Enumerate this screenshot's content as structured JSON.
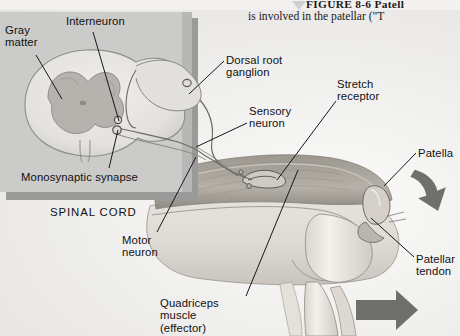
{
  "figure": {
    "caption_line1": "FIGURE  8-6  Patell",
    "caption_line2": "is involved in the patellar (\"T",
    "marker_icon": "triangle-marker-icon"
  },
  "panel": {
    "name": "spinal-cord-inset-panel",
    "background_color": "#c8c8c6",
    "shadow_color": "#9a9a98"
  },
  "labels": [
    {
      "id": "gray-matter",
      "text": "Gray\nmatter",
      "x": 5,
      "y": 14,
      "align": "left"
    },
    {
      "id": "interneuron",
      "text": "Interneuron",
      "x": 66,
      "y": 5,
      "align": "left"
    },
    {
      "id": "monosynaptic-synapse",
      "text": "Monosynaptic synapse",
      "x": 21,
      "y": 161,
      "align": "left"
    },
    {
      "id": "spinal-cord",
      "text": "SPINAL CORD",
      "x": 50,
      "y": 196,
      "align": "left"
    },
    {
      "id": "dorsal-root-ganglion",
      "text": "Dorsal root\nganglion",
      "x": 226,
      "y": 44,
      "align": "left"
    },
    {
      "id": "sensory-neuron",
      "text": "Sensory\nneuron",
      "x": 249,
      "y": 95,
      "align": "left"
    },
    {
      "id": "stretch-receptor",
      "text": "Stretch\nreceptor",
      "x": 337,
      "y": 68,
      "align": "left"
    },
    {
      "id": "patella",
      "text": "Patella",
      "x": 418,
      "y": 137,
      "align": "left"
    },
    {
      "id": "patellar-tendon",
      "text": "Patellar\ntendon",
      "x": 416,
      "y": 243,
      "align": "left"
    },
    {
      "id": "motor-neuron",
      "text": "Motor\nneuron",
      "x": 122,
      "y": 224,
      "align": "left"
    },
    {
      "id": "quadriceps-muscle",
      "text": "Quadriceps\nmuscle\n(effector)",
      "x": 160,
      "y": 287,
      "align": "left"
    }
  ],
  "leaders": [
    {
      "id": "leader-gray-matter",
      "x1": 36,
      "y1": 45,
      "x2": 62,
      "y2": 89
    },
    {
      "id": "leader-interneuron",
      "x1": 93,
      "y1": 22,
      "x2": 119,
      "y2": 111
    },
    {
      "id": "leader-monosynaptic-synapse",
      "x1": 109,
      "y1": 158,
      "x2": 118,
      "y2": 120
    },
    {
      "id": "leader-dorsal-root-ganglion",
      "x1": 224,
      "y1": 51,
      "x2": 189,
      "y2": 84
    },
    {
      "id": "leader-sensory-neuron",
      "x1": 247,
      "y1": 113,
      "x2": 196,
      "y2": 137
    },
    {
      "id": "leader-stretch-receptor",
      "x1": 336,
      "y1": 91,
      "x2": 277,
      "y2": 170
    },
    {
      "id": "leader-patella",
      "x1": 416,
      "y1": 143,
      "x2": 384,
      "y2": 176
    },
    {
      "id": "leader-patellar-tendon",
      "x1": 414,
      "y1": 247,
      "x2": 371,
      "y2": 208
    },
    {
      "id": "leader-motor-neuron",
      "x1": 157,
      "y1": 222,
      "x2": 196,
      "y2": 147
    },
    {
      "id": "leader-quadriceps-muscle",
      "x1": 246,
      "y1": 286,
      "x2": 298,
      "y2": 160
    }
  ],
  "arrows": [
    {
      "id": "tap-arrow",
      "label": "patellar-tendon-tap-arrow",
      "color": "#6f6f6d"
    },
    {
      "id": "kick-arrow",
      "label": "leg-kick-arrow",
      "color": "#6f6f6d"
    }
  ],
  "anatomy": {
    "spinal_cord_section": "spinal-cord-cross-section",
    "gray_matter_shape": "butterfly-gray-matter",
    "dorsal_root_ganglion": "dorsal-root-ganglion",
    "sensory_neuron_path": "sensory-neuron-axon",
    "motor_neuron_path": "motor-neuron-axon",
    "interneuron_body": "interneuron-cell-body",
    "quadriceps_muscle": "quadriceps-muscle",
    "femur_bone": "femur-bone",
    "tibia_bone": "tibia-bone",
    "fibula_bone": "fibula-bone",
    "patella_bone": "patella-bone",
    "patellar_tendon": "patellar-tendon",
    "muscle_spindle": "muscle-spindle-stretch-receptor"
  },
  "colors": {
    "ink": "#1b1b1b",
    "paper": "#efeeec",
    "panel_gray": "#c8c8c6",
    "tissue_light": "#e9e7e3",
    "tissue_mid": "#cfccc6",
    "tissue_dark": "#a9a59e",
    "bone": "#eceae5",
    "muscle": "#bdb9b2",
    "arrow_gray": "#6f6f6d"
  }
}
